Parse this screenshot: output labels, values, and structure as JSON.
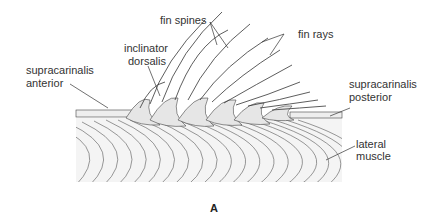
{
  "figure": {
    "panel_label": "A",
    "labels": {
      "fin_spines": "fin spines",
      "fin_rays": "fin rays",
      "inclinator_1": "inclinator",
      "inclinator_2": "dorsalis",
      "supra_ant_1": "supracarinalis",
      "supra_ant_2": "anterior",
      "supra_post_1": "supracarinalis",
      "supra_post_2": "posterior",
      "lateral_1": "lateral",
      "lateral_2": "muscle"
    },
    "colors": {
      "line": "#333333",
      "fill": "#f2f2f2",
      "background": "#ffffff"
    }
  }
}
